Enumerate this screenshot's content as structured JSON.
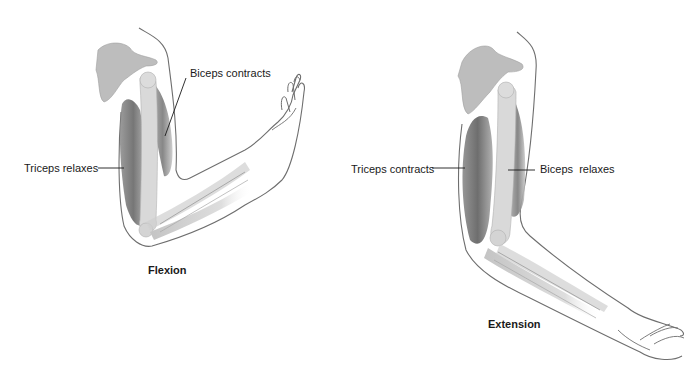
{
  "figure": {
    "panels": [
      {
        "id": "flexion",
        "caption": "Flexion",
        "labels": [
          {
            "text": "Triceps relaxes"
          },
          {
            "text": "Biceps contracts"
          }
        ]
      },
      {
        "id": "extension",
        "caption": "Extension",
        "labels": [
          {
            "text": "Triceps contracts"
          },
          {
            "text": "Biceps  relaxes"
          }
        ]
      }
    ],
    "colors": {
      "outline": "#6e6e6e",
      "bone": "#d9d9d9",
      "scapula": "#bdbdbd",
      "muscle_dark": "#6a6a6a",
      "muscle_light": "#b5b5b5",
      "leader_line": "#1a1a1a"
    }
  }
}
